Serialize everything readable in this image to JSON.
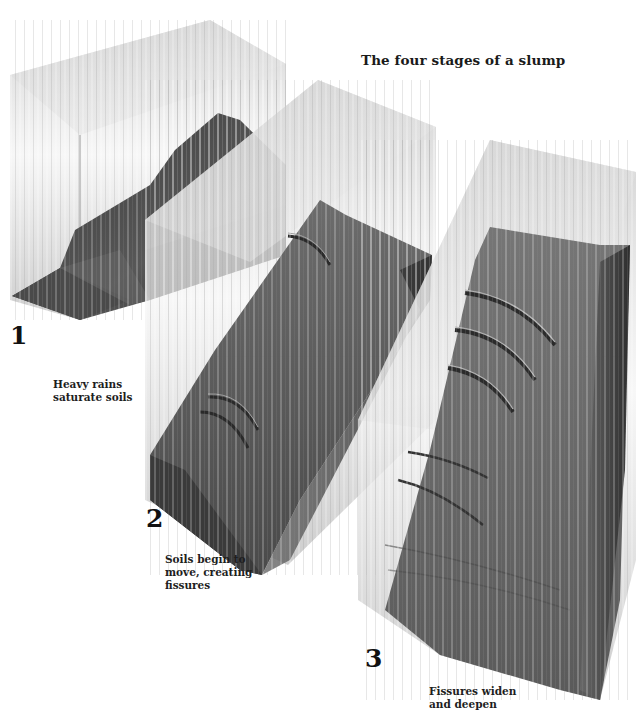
{
  "figure": {
    "title": "The four stages of a slump",
    "colors": {
      "background": "#ffffff",
      "glass": "#c8c8c8",
      "soil_dark": "#2e2e2e",
      "soil_mid": "#555555",
      "rain": "#f2f2f2",
      "text": "#1a1a1a"
    }
  },
  "stages": [
    {
      "number": "1",
      "caption_line1": "Heavy rains",
      "caption_line2": "saturate soils",
      "caption_line3": ""
    },
    {
      "number": "2",
      "caption_line1": "Soils begin to",
      "caption_line2": "move, creating",
      "caption_line3": "fissures"
    },
    {
      "number": "3",
      "caption_line1": "Fissures widen",
      "caption_line2": "and deepen",
      "caption_line3": ""
    }
  ]
}
